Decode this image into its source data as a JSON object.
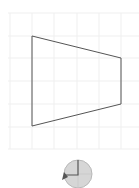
{
  "canvas": {
    "width": 139,
    "height": 188,
    "background": "#ffffff"
  },
  "grid": {
    "x_lines": [
      10,
      32,
      54,
      77,
      99,
      121
    ],
    "y_lines": [
      13,
      36,
      58,
      81,
      104,
      127,
      149
    ],
    "x_start": 8,
    "x_end": 139,
    "y_start": 13,
    "y_end": 149,
    "color": "#efefef"
  },
  "shape": {
    "type": "quadrilateral",
    "points": [
      [
        32,
        36
      ],
      [
        121,
        58
      ],
      [
        121,
        104
      ],
      [
        32,
        126
      ]
    ],
    "stroke": "#555555",
    "fill": "none",
    "stroke_width": 1
  },
  "rotate_handle": {
    "icon": "rotate-dial-icon",
    "center": [
      78,
      174
    ],
    "radius": 14,
    "fill": "#d6d6d6",
    "stroke": "#b8b8b8",
    "indicator_color": "#555555"
  }
}
